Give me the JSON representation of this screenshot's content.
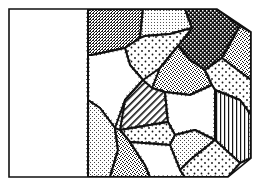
{
  "illustration": {
    "subject": "crazy quilt patchwork tag",
    "background": "#ffffff",
    "ink": "#111111",
    "outline": [
      [
        9,
        9
      ],
      [
        217,
        9
      ],
      [
        251,
        32
      ],
      [
        251,
        158
      ],
      [
        228,
        177
      ],
      [
        9,
        177
      ]
    ],
    "blank_panel": {
      "x": 9,
      "y": 9,
      "width": 79,
      "height": 168
    },
    "divider": {
      "x": 88,
      "y1": 9,
      "y2": 177,
      "style": "dashed"
    },
    "patches": [
      {
        "id": "p1",
        "fill": "dense-stipple",
        "points": "88,9 143,9 140,38 125,48 92,55 88,55"
      },
      {
        "id": "p2",
        "fill": "fine-dots",
        "points": "143,9 185,9 192,28 170,34 145,36 140,38"
      },
      {
        "id": "p3",
        "fill": "checker",
        "points": "185,9 217,9 240,26 222,58 205,70 190,60 178,46 192,28"
      },
      {
        "id": "p4",
        "fill": "stipple",
        "points": "240,26 251,32 251,80 235,68 222,58"
      },
      {
        "id": "p5",
        "fill": "sparse-dots",
        "points": "125,48 140,38 145,36 170,34 192,28 178,46 160,68 143,80 130,65"
      },
      {
        "id": "p6",
        "fill": "white",
        "points": "88,55 92,55 125,48 130,65 143,80 125,100 115,128 100,108 88,100"
      },
      {
        "id": "p7",
        "fill": "stipple",
        "points": "160,68 178,46 190,60 205,70 212,85 190,95 165,92 152,88"
      },
      {
        "id": "p8",
        "fill": "sparse-dots",
        "points": "205,70 222,58 235,68 251,80 251,115 240,100 215,90 212,85"
      },
      {
        "id": "p9",
        "fill": "diagonal-hatch",
        "points": "125,100 143,80 152,88 165,92 168,122 120,130"
      },
      {
        "id": "p10",
        "fill": "vertical-stripes",
        "points": "215,90 240,100 251,115 251,158 240,163 215,140"
      },
      {
        "id": "p11",
        "fill": "white",
        "points": "165,92 190,95 212,85 215,90 215,140 195,130 175,135 168,122"
      },
      {
        "id": "p12",
        "fill": "light-stipple",
        "points": "88,100 100,108 115,128 118,150 110,177 88,177"
      },
      {
        "id": "p13",
        "fill": "sparse-dots",
        "points": "120,130 168,122 175,135 170,145 130,142"
      },
      {
        "id": "p14",
        "fill": "stipple",
        "points": "115,128 120,130 130,142 145,165 150,177 110,177 118,150"
      },
      {
        "id": "p15",
        "fill": "light-stipple",
        "points": "175,135 195,130 215,140 190,160 180,170 170,145"
      },
      {
        "id": "p16",
        "fill": "white",
        "points": "130,142 170,145 180,170 185,177 150,177 145,165"
      },
      {
        "id": "p17",
        "fill": "sparse-dots",
        "points": "190,160 215,140 240,163 228,177 185,177 180,170"
      }
    ]
  }
}
